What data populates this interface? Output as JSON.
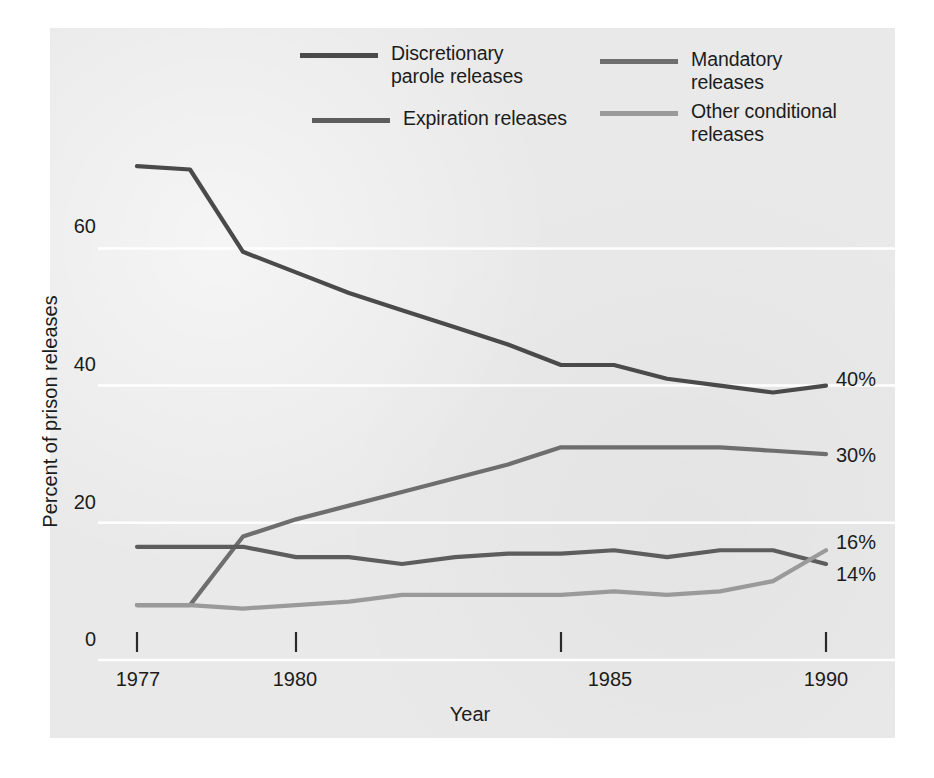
{
  "figure": {
    "background_color": "#ffffff",
    "panel_color": "#e9e9e9"
  },
  "axes": {
    "ylabel": "Percent of prison releases",
    "xlabel": "Year",
    "yticks": [
      "0",
      "20",
      "40",
      "60"
    ],
    "xticks": [
      "1977",
      "1980",
      "1985",
      "1990"
    ]
  },
  "legend": {
    "items": [
      {
        "key": "discretionary",
        "label": "Discretionary\nparole releases",
        "color": "#4a4a4a"
      },
      {
        "key": "mandatory",
        "label": "Mandatory releases",
        "color": "#6e6e6e"
      },
      {
        "key": "expiration",
        "label": "Expiration releases",
        "color": "#5d5d5d"
      },
      {
        "key": "other",
        "label": "Other conditional\nreleases",
        "color": "#9a9a9a"
      }
    ]
  },
  "end_labels": {
    "discretionary": "40%",
    "mandatory": "30%",
    "other_conditional": "16%",
    "expiration": "14%"
  },
  "chart_data": {
    "type": "line",
    "title": "",
    "xlabel": "Year",
    "ylabel": "Percent of prison releases",
    "xlim": [
      1977,
      1990
    ],
    "ylim": [
      0,
      72
    ],
    "grid": true,
    "grid_color": "#ffffff",
    "legend_position": "top",
    "x": [
      1977,
      1978,
      1979,
      1980,
      1981,
      1982,
      1983,
      1984,
      1985,
      1986,
      1987,
      1988,
      1989,
      1990
    ],
    "series": [
      {
        "name": "Discretionary parole releases",
        "color": "#4a4a4a",
        "end_label": "40%",
        "values": [
          72,
          71.5,
          59.5,
          56.5,
          53.5,
          51,
          48.5,
          46,
          43,
          43,
          41,
          40,
          39,
          40
        ]
      },
      {
        "name": "Mandatory releases",
        "color": "#6e6e6e",
        "end_label": "30%",
        "values": [
          8,
          8,
          18,
          20.5,
          22.5,
          24.5,
          26.5,
          28.5,
          31,
          31,
          31,
          31,
          30.5,
          30
        ]
      },
      {
        "name": "Expiration releases",
        "color": "#5d5d5d",
        "end_label": "14%",
        "values": [
          16.5,
          16.5,
          16.5,
          15,
          15,
          14,
          15,
          15.5,
          15.5,
          16,
          15,
          16,
          16,
          14
        ]
      },
      {
        "name": "Other conditional releases",
        "color": "#9a9a9a",
        "end_label": "16%",
        "values": [
          8,
          8,
          7.5,
          8,
          8.5,
          9.5,
          9.5,
          9.5,
          9.5,
          10,
          9.5,
          10,
          11.5,
          16
        ]
      }
    ]
  }
}
